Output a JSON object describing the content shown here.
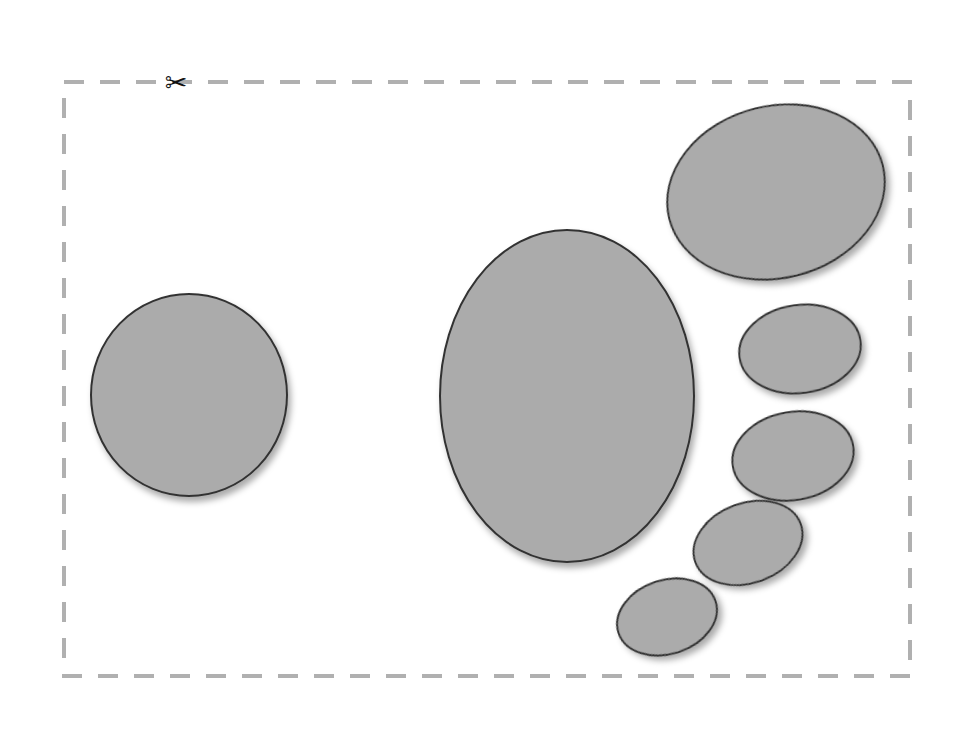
{
  "page": {
    "title": "Cut-out ellipse worksheet",
    "width": 977,
    "height": 730,
    "background_color": "#ffffff"
  },
  "cut_border": {
    "name": "cut-line",
    "x": 64,
    "y": 82,
    "width": 846,
    "height": 594,
    "stroke_color": "#b0b0b0",
    "stroke_width": 4,
    "dash_length": 20,
    "dash_gap": 16
  },
  "scissors": {
    "icon_name": "scissors-icon",
    "glyph": "✂",
    "x": 176,
    "y": 82,
    "color": "#111111",
    "size": 27
  },
  "shapes": {
    "fill_color": "#ababab",
    "stroke_color": "#333333",
    "stroke_width": 2,
    "shadow_color": "rgba(0,0,0,0.30)",
    "count": 6,
    "items": [
      {
        "name": "ellipse-left-large",
        "label": "Left circle",
        "cx": 189,
        "cy": 395,
        "rx": 98,
        "ry": 101,
        "rotation": 0
      },
      {
        "name": "ellipse-center-largest",
        "label": "Center large oval",
        "cx": 567,
        "cy": 396,
        "rx": 127,
        "ry": 166,
        "rotation": 0
      },
      {
        "name": "ellipse-top-right",
        "label": "Top right oval",
        "cx": 776,
        "cy": 192,
        "rx": 110,
        "ry": 86,
        "rotation": -14
      },
      {
        "name": "ellipse-right-upper-small",
        "label": "Right upper small oval",
        "cx": 800,
        "cy": 349,
        "rx": 61,
        "ry": 44,
        "rotation": -8
      },
      {
        "name": "ellipse-right-lower-small",
        "label": "Right lower small oval",
        "cx": 793,
        "cy": 456,
        "rx": 61,
        "ry": 44,
        "rotation": -10
      },
      {
        "name": "ellipse-lower-right-small",
        "label": "Lower right small oval",
        "cx": 748,
        "cy": 543,
        "rx": 56,
        "ry": 40,
        "rotation": -20
      },
      {
        "name": "ellipse-bottom-small",
        "label": "Bottom small oval",
        "cx": 667,
        "cy": 617,
        "rx": 51,
        "ry": 37,
        "rotation": -18
      }
    ]
  }
}
